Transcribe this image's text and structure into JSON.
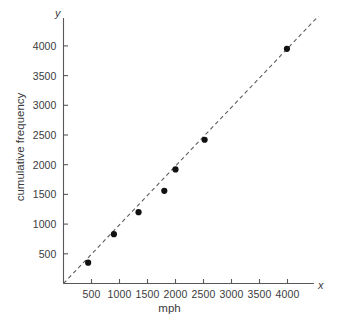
{
  "chart_data": {
    "type": "scatter",
    "title": "",
    "xlabel": "mph",
    "ylabel": "cumulative frequency",
    "x_axis_name": "x",
    "y_axis_name": "y",
    "xlim": [
      0,
      4500
    ],
    "ylim": [
      0,
      4400
    ],
    "grid": false,
    "legend": null,
    "x_ticks": [
      500,
      1000,
      1500,
      2000,
      2500,
      3000,
      3500,
      4000
    ],
    "x_tick_labels": [
      "500",
      "1000",
      "1500",
      "2000",
      "2500",
      "3000",
      "3500",
      "4000"
    ],
    "y_ticks": [
      500,
      1000,
      1500,
      2000,
      2500,
      3000,
      3500,
      4000
    ],
    "y_tick_labels": [
      "500",
      "1000",
      "1500",
      "2000",
      "2500",
      "3000",
      "3500",
      "4000"
    ],
    "points": [
      {
        "x": 440,
        "y": 350
      },
      {
        "x": 900,
        "y": 830
      },
      {
        "x": 1340,
        "y": 1200
      },
      {
        "x": 1800,
        "y": 1560
      },
      {
        "x": 2000,
        "y": 1920
      },
      {
        "x": 2520,
        "y": 2420
      },
      {
        "x": 3990,
        "y": 3950
      }
    ],
    "marker": {
      "shape": "circle",
      "radius": 3.1,
      "color": "#111111"
    },
    "fit_line": {
      "style": "dashed",
      "color": "#5d5d60",
      "x_start": 0,
      "y_start": 0,
      "x_end": 4550,
      "y_end": 4500
    }
  }
}
